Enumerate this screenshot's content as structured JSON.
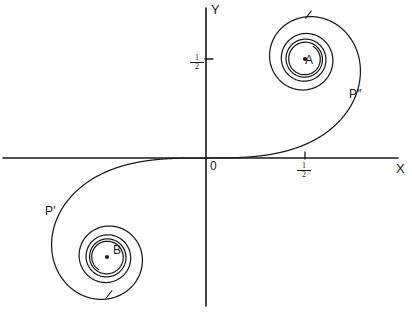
{
  "figure": {
    "name": "cornu-spiral",
    "background": "#ffffff",
    "ink": "#1a1a1a",
    "width": 412,
    "height": 312
  },
  "axes": {
    "x_label": "X",
    "y_label": "Y",
    "origin_label": "0",
    "x_tick_label_num": "1",
    "x_tick_label_den": "2",
    "y_tick_label_num": "1",
    "y_tick_label_den": "2"
  },
  "points": {
    "a_label": "A",
    "b_label": "B",
    "p_upper_label": "P″",
    "p_lower_label": "P′"
  },
  "chart_data": {
    "type": "line",
    "title": "",
    "xlabel": "X",
    "ylabel": "Y",
    "curve_name": "Cornu spiral (Euler spiral / clothoid)",
    "parametric": {
      "x_of_t": "C(t) = ∫₀ᵗ cos(πu²/2) du",
      "y_of_t": "S(t) = ∫₀ᵗ sin(πu²/2) du",
      "t_range": [
        -4.2,
        4.2
      ]
    },
    "grid": false,
    "legend": false,
    "axis_units_per_half": 0.5,
    "xlim": [
      -2.05,
      2.05
    ],
    "ylim": [
      -1.55,
      1.55
    ],
    "x_ticks": [
      0.5
    ],
    "y_ticks": [
      0.5
    ],
    "annotations": [
      {
        "label": "A",
        "x": 0.5,
        "y": 0.5,
        "kind": "asymptotic-point",
        "dot": true
      },
      {
        "label": "B",
        "x": -0.5,
        "y": -0.5,
        "kind": "asymptotic-point",
        "dot": true
      },
      {
        "label": "P″",
        "t": 1.45,
        "kind": "curve-point"
      },
      {
        "label": "P′",
        "t": -1.45,
        "kind": "curve-point"
      },
      {
        "label": "0",
        "x": 0,
        "y": 0,
        "kind": "origin"
      }
    ]
  },
  "geometry": {
    "origin_px": [
      206,
      158
    ],
    "scale_px_per_unit": 198,
    "x_axis_from_px": 3,
    "x_axis_to_px": 398,
    "y_axis_from_px": 8,
    "y_axis_to_px": 306
  }
}
